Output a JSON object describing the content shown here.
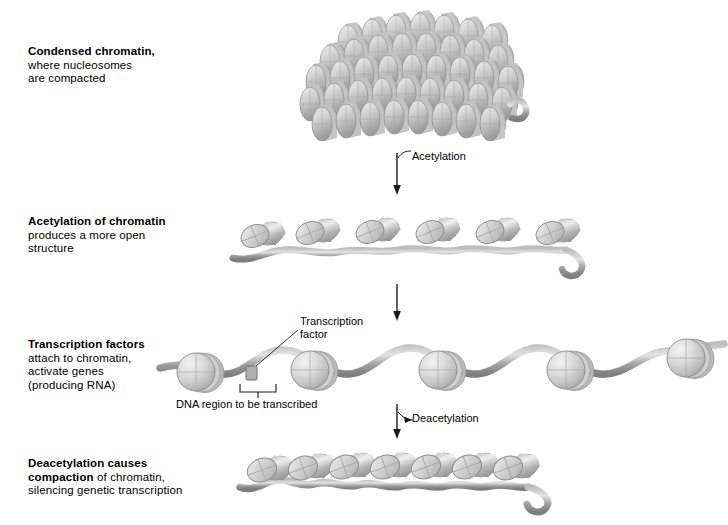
{
  "figure": {
    "background_color": "#ffffff",
    "nucleosome_color": "#c9c9c9",
    "dna_color": "#9a9a9a",
    "text_color": "#000000"
  },
  "captions": [
    {
      "id": "condensed-chromatin",
      "bold": "Condensed chromatin,",
      "line2": "where nucleosomes",
      "line3": "are compacted"
    },
    {
      "id": "acetylation-of-chromatin",
      "bold": "Acetylation of chromatin",
      "line2": "produces a more open",
      "line3": "structure"
    },
    {
      "id": "transcription-factors",
      "bold": "Transcription factors",
      "line2": "attach to chromatin,",
      "line3": "activate genes",
      "line4": "(producing RNA)"
    },
    {
      "id": "deacetylation",
      "bold": "Deacetylation causes",
      "bold2": "compaction",
      "rest2": " of chromatin,",
      "line3": "silencing genetic transcription"
    }
  ],
  "annotations": {
    "acetylation_label": "Acetylation",
    "deacetylation_label": "Deacetylation",
    "transcription_factor_line1": "Transcription",
    "transcription_factor_line2": "factor",
    "dna_region_label": "DNA region to be transcribed"
  },
  "stages": [
    {
      "name": "condensed-chromatin-cluster",
      "description": "Dense 3D stack of disc-shaped nucleosomes",
      "nucleosome_count": 46
    },
    {
      "name": "acetylated-chromatin-strand",
      "description": "Open beads-on-a-string with tilted nucleosome discs",
      "nucleosome_count": 6
    },
    {
      "name": "transcription-factor-strand",
      "description": "Extended chromatin with face-on nucleosomes and bound transcription factor",
      "nucleosome_count": 6
    },
    {
      "name": "deacetylated-compacted-strand",
      "description": "Re-compacted nucleosome array with curled DNA tail",
      "nucleosome_count": 7
    }
  ],
  "arrows": [
    {
      "name": "acetylation-arrow",
      "label": "Acetylation"
    },
    {
      "name": "transition-arrow",
      "label": ""
    },
    {
      "name": "deacetylation-arrow",
      "label": "Deacetylation"
    }
  ]
}
